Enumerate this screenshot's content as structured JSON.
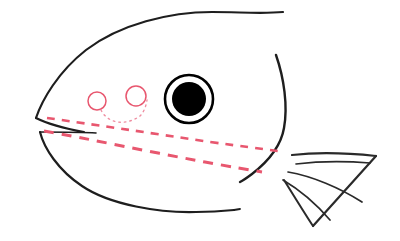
{
  "document": {
    "title": "Fish Head Line Drawing",
    "canvas_width": 400,
    "canvas_height": 241,
    "background_color": "#ffffff",
    "medium": "hand-drawn line art sketch"
  },
  "palette": {
    "ink_black": "#1e1e1e",
    "ink_gray": "#2a2a2a",
    "guide_pink": "#e8576f",
    "guide_pink_light": "#ef8fa2",
    "pupil_black": "#000000",
    "paper_white": "#ffffff"
  },
  "figure": {
    "parts": [
      {
        "id": "head-top-outline",
        "label": "Head Top Outline",
        "color": "#1e1e1e",
        "stroke_width": 2.2
      },
      {
        "id": "snout-lower-outline",
        "label": "Snout Lower Outline",
        "color": "#1e1e1e",
        "stroke_width": 2.2
      },
      {
        "id": "lower-jaw-outline",
        "label": "Lower Jaw Outline",
        "color": "#1e1e1e",
        "stroke_width": 2.2
      },
      {
        "id": "belly-outline",
        "label": "Belly Outline",
        "color": "#1e1e1e",
        "stroke_width": 2.2
      },
      {
        "id": "gill-cover-line",
        "label": "Gill Cover Line",
        "color": "#1e1e1e",
        "stroke_width": 2.4
      },
      {
        "id": "eye",
        "label": "Eye",
        "color": "#000000",
        "stroke_width": 2.4
      },
      {
        "id": "pectoral-fin",
        "label": "Pectoral Fin",
        "color": "#2a2a2a",
        "stroke_width": 2.0
      },
      {
        "id": "nostril-circle-left",
        "label": "Left Nostril Circle",
        "color": "#e8576f",
        "stroke_width": 1.4
      },
      {
        "id": "nostril-circle-right",
        "label": "Right Nostril Circle",
        "color": "#e8576f",
        "stroke_width": 1.4
      },
      {
        "id": "dotted-arc",
        "label": "Dotted Connector Arc",
        "color": "#ef8fa2",
        "stroke_width": 1.3
      },
      {
        "id": "guide-dash-upper",
        "label": "Upper Dashed Guide Line",
        "color": "#e8576f",
        "stroke_width": 2.6
      },
      {
        "id": "guide-dash-lower",
        "label": "Lower Dashed Guide Line",
        "color": "#e8576f",
        "stroke_width": 3.0
      }
    ]
  },
  "geometry": {
    "head_top": "M 36,118 C 42,100 58,72 86,50 C 120,24 170,12 212,12 C 240,12 262,14 283,12",
    "snout_lower": "M 36,118 C 44,122 62,128 84,132",
    "jaw_upper": "M 40,132 C 60,132 82,132 96,133",
    "jaw_curve": "M 40,132 C 44,148 58,170 82,186 C 110,205 160,213 196,212 C 212,212 224,211 234,210",
    "belly_end": "M 234,210 L 240,209",
    "gill_cover": "M 276,55 C 284,78 288,106 284,128 C 281,146 270,160 252,174 C 248,177 244,180 240,182",
    "fin_top": "M 292,155 C 318,152 348,153 376,156",
    "fin_right": "M 376,156 L 313,226",
    "fin_bottom": "M 313,226 C 305,214 294,196 284,180",
    "fin_ray_1": "M 296,164 C 320,161 346,161 370,163",
    "fin_ray_2": "M 288,172 C 312,176 340,188 362,202",
    "fin_ray_3": "M 283,180 C 300,190 318,206 330,220",
    "eye_center_x": 189,
    "eye_center_y": 99,
    "eye_outer_r": 24,
    "eye_pupil_r": 17,
    "nostril_left": {
      "cx": 97,
      "cy": 101,
      "r": 9
    },
    "nostril_right": {
      "cx": 136,
      "cy": 96,
      "r": 10
    },
    "dotted_arc": "M 101,110 C 108,124 126,126 140,116 C 144,112 146,106 147,100",
    "guide_upper": "M 47,118 C 90,124 150,133 210,142 C 240,146 262,149 278,151",
    "guide_lower": "M 44,131 C 90,139 150,152 205,162 C 232,167 250,170 262,172"
  }
}
